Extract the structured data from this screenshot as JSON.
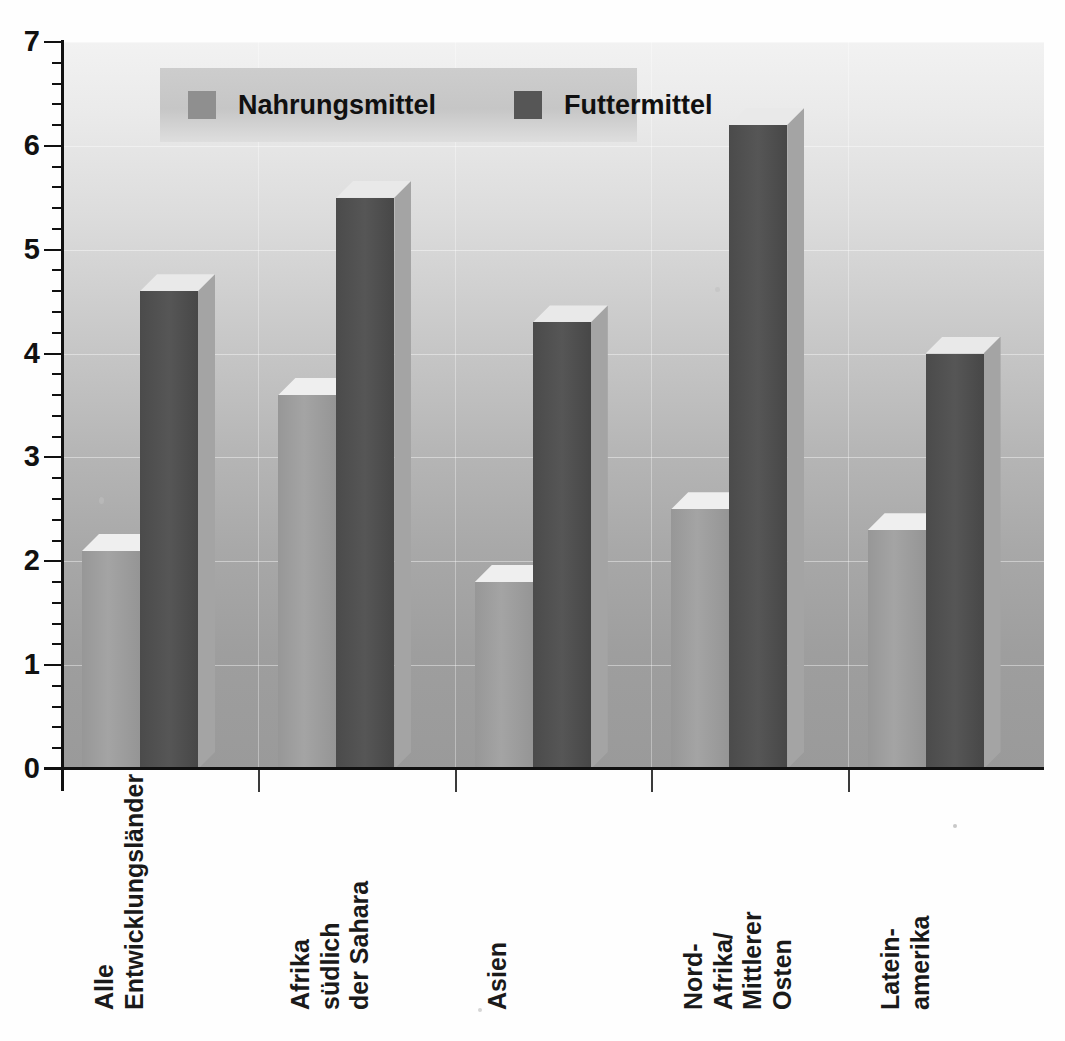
{
  "chart_data": {
    "type": "bar",
    "title": "",
    "subtitle": "",
    "xlabel": "",
    "ylabel": "",
    "ylim": [
      0,
      7
    ],
    "y_major_step": 1,
    "y_minor_step": 0.2,
    "grid": true,
    "legend_position": "top-left-inside",
    "style": "3d-grouped-bar",
    "categories": [
      "Alle Entwicklungsländer",
      "Afrika südlich der Sahara",
      "Asien",
      "Nord-Afrika/Mittlerer Osten",
      "Latein-amerika"
    ],
    "category_label_lines": [
      [
        "Alle",
        "Entwicklungsländer"
      ],
      [
        "Afrika",
        "südlich",
        "der Sahara"
      ],
      [
        "Asien"
      ],
      [
        "Nord-",
        "Afrika/",
        "Mittlerer",
        "Osten"
      ],
      [
        "Latein-",
        "amerika"
      ]
    ],
    "series": [
      {
        "name": "Nahrungsmittel",
        "color": "#8f8f8f",
        "values": [
          2.1,
          3.6,
          1.8,
          2.5,
          2.3
        ]
      },
      {
        "name": "Futtermittel",
        "color": "#565656",
        "values": [
          4.6,
          5.5,
          4.3,
          6.2,
          4.0
        ]
      }
    ],
    "y_tick_labels": [
      "0",
      "1",
      "2",
      "3",
      "4",
      "5",
      "6",
      "7"
    ]
  },
  "legend": {
    "entries": [
      {
        "label": "Nahrungsmittel",
        "swatch": "light-gray-swatch"
      },
      {
        "label": "Futtermittel",
        "swatch": "dark-gray-swatch"
      }
    ]
  },
  "colors": {
    "series_light": "#8f8f8f",
    "series_dark": "#565656",
    "axis": "#111111",
    "plot_bg_top": "#f2f2f2",
    "plot_bg_bottom": "#9a9a9a"
  }
}
